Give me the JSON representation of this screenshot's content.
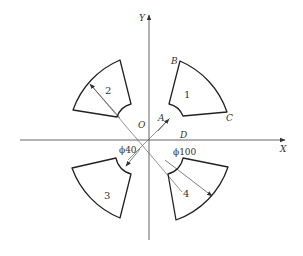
{
  "diagram": {
    "axes": {
      "x_label": "X",
      "y_label": "Y",
      "origin_label": "O"
    },
    "points": {
      "A": "A",
      "B": "B",
      "C": "C",
      "D": "D"
    },
    "sectors": [
      {
        "id": "1",
        "label": "1"
      },
      {
        "id": "2",
        "label": "2"
      },
      {
        "id": "3",
        "label": "3"
      },
      {
        "id": "4",
        "label": "4"
      }
    ],
    "dimensions": {
      "inner_diameter": "ϕ40",
      "outer_diameter": "ϕ100"
    },
    "colors": {
      "stroke": "#222222",
      "thin_line": "#555555",
      "background": "#ffffff"
    }
  }
}
